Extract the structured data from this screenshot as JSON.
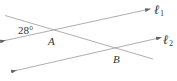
{
  "diagram": {
    "angle_label": "28°",
    "points": {
      "A": "A",
      "B": "B"
    },
    "lines": {
      "l1": {
        "symbol": "ℓ",
        "subscript": "1"
      },
      "l2": {
        "symbol": "ℓ",
        "subscript": "2"
      }
    },
    "colors": {
      "line": "#999999",
      "text": "#333333",
      "background": "#ffffff"
    }
  }
}
